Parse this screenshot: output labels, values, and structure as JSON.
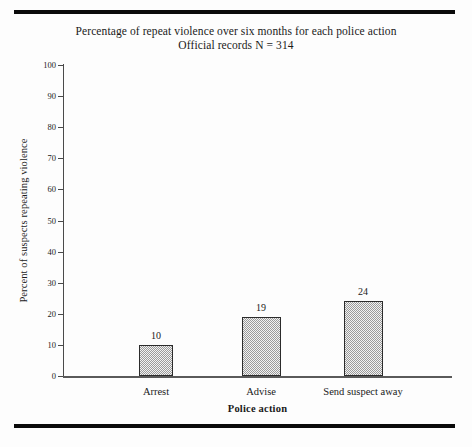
{
  "figure": {
    "title_line1": "Percentage of repeat violence over six months for each police action",
    "title_line2": "Official records  N = 314",
    "top_rule": "horizontal-rule",
    "bottom_rule": "horizontal-rule"
  },
  "chart_data": {
    "type": "bar",
    "title": "Percentage of repeat violence over six months for each police action\nOfficial records  N = 314",
    "subtitle": "Official records  N = 314",
    "categories": [
      "Arrest",
      "Advise",
      "Send suspect away"
    ],
    "values": [
      10,
      19,
      24
    ],
    "value_labels": [
      "10",
      "19",
      "24"
    ],
    "xlabel": "Police action",
    "ylabel": "Percent of suspects repeating violence",
    "ylim": [
      0,
      100
    ],
    "ytick_labels": [
      "0",
      "10",
      "20",
      "30",
      "40",
      "50",
      "60",
      "70",
      "80",
      "90",
      "100"
    ],
    "ytick_values": [
      0,
      10,
      20,
      30,
      40,
      50,
      60,
      70,
      80,
      90,
      100
    ],
    "grid": false,
    "legend": null,
    "bar_fill_color": "#f2f2f2",
    "bar_pattern_color": "#9a9a9a",
    "bar_edge_color": "#2b2b2b",
    "axis_color": "#4a4a4a",
    "background_color": "#fdfdfd"
  }
}
